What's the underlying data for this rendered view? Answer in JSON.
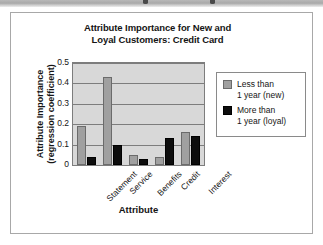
{
  "figure": {
    "border_color": "#a8a8a8",
    "background": "#ffffff"
  },
  "chart_data": {
    "type": "bar",
    "title": "Attribute Importance for New and Loyal Customers: Credit Card",
    "title_line1": "Attribute Importance for New and",
    "title_line2": "Loyal Customers: Credit Card",
    "xlabel": "Attribute",
    "ylabel": "Attribute Importance (regression coefficient)",
    "ylabel_line1": "Attribute Importance",
    "ylabel_line2": "(regression coefficient)",
    "categories": [
      "Statement",
      "Service",
      "Benefits",
      "Credit",
      "Interest"
    ],
    "series": [
      {
        "name": "Less than 1 year (new)",
        "name_line1": "Less than",
        "name_line2": "1 year (new)",
        "color": "#a0a0a0",
        "values": [
          0.19,
          0.43,
          0.05,
          0.04,
          0.16
        ]
      },
      {
        "name": "More than 1 year (loyal)",
        "name_line1": "More than",
        "name_line2": "1 year (loyal)",
        "color": "#0d0d0d",
        "values": [
          0.04,
          0.1,
          0.03,
          0.13,
          0.14
        ]
      }
    ],
    "ylim": [
      0,
      0.5
    ],
    "yticks": [
      "0.5",
      "0.4",
      "0.3",
      "0.2",
      "0.1",
      "0"
    ],
    "ytick_values": [
      0.5,
      0.4,
      0.3,
      0.2,
      0.1,
      0
    ],
    "grid": true,
    "legend_position": "right",
    "plot_background": "#d8d8d8"
  }
}
